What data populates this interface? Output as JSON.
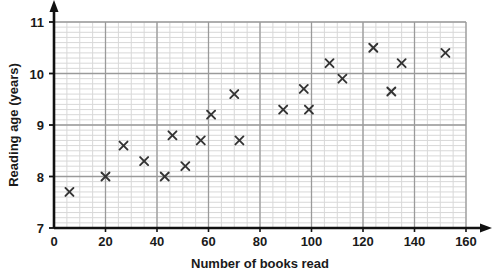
{
  "chart_data": {
    "type": "scatter",
    "title": "",
    "xlabel": "Number of books read",
    "ylabel": "Reading age (years)",
    "xlim": [
      0,
      160
    ],
    "ylim": [
      7,
      11
    ],
    "x_ticks": [
      0,
      20,
      40,
      60,
      80,
      100,
      120,
      140,
      160
    ],
    "y_ticks": [
      7,
      8,
      9,
      10,
      11
    ],
    "x_tick_labels": [
      "0",
      "20",
      "40",
      "60",
      "80",
      "100",
      "120",
      "140",
      "160"
    ],
    "y_tick_labels": [
      "7",
      "8",
      "9",
      "10",
      "11"
    ],
    "x_major_step": 20,
    "x_minor_step": 5,
    "y_major_step": 1,
    "y_minor_step": 0.1,
    "grid": true,
    "grid_minor": true,
    "legend": false,
    "marker": "x",
    "marker_color": "#333333",
    "grid_major_color": "#9a9a9a",
    "grid_minor_color": "#d8d8d8",
    "axis_color": "#111111",
    "background_color": "#ffffff",
    "points": [
      {
        "x": 6,
        "y": 7.7
      },
      {
        "x": 20,
        "y": 8.0
      },
      {
        "x": 27,
        "y": 8.6
      },
      {
        "x": 35,
        "y": 8.3
      },
      {
        "x": 43,
        "y": 8.0
      },
      {
        "x": 46,
        "y": 8.8
      },
      {
        "x": 51,
        "y": 8.2
      },
      {
        "x": 57,
        "y": 8.7
      },
      {
        "x": 61,
        "y": 9.2
      },
      {
        "x": 70,
        "y": 9.6
      },
      {
        "x": 72,
        "y": 8.7
      },
      {
        "x": 89,
        "y": 9.3
      },
      {
        "x": 97,
        "y": 9.7
      },
      {
        "x": 99,
        "y": 9.3
      },
      {
        "x": 107,
        "y": 10.2
      },
      {
        "x": 112,
        "y": 9.9
      },
      {
        "x": 124,
        "y": 10.5
      },
      {
        "x": 131,
        "y": 9.65
      },
      {
        "x": 135,
        "y": 10.2
      },
      {
        "x": 152,
        "y": 10.4
      }
    ]
  }
}
